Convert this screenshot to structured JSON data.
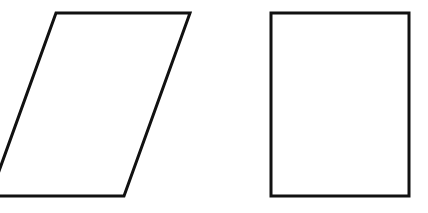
{
  "diagram": {
    "background": "#ffffff",
    "stroke_color": "#111111",
    "stroke_width": 3,
    "shapes": [
      {
        "name": "parallelogram",
        "type": "polygon",
        "points": "56,13 190,13 124,196 0,196 -6,196 0,180"
      },
      {
        "name": "rectangle",
        "type": "rect",
        "x": 271,
        "y": 13,
        "width": 138,
        "height": 183
      }
    ]
  }
}
